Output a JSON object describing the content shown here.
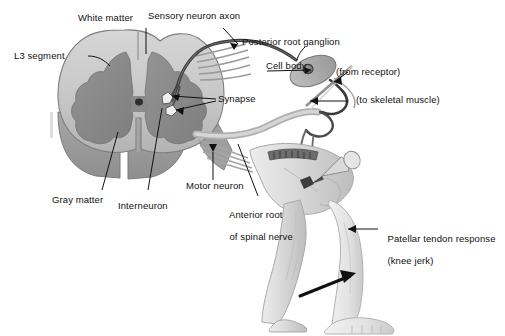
{
  "figure": {
    "type": "anatomical-diagram",
    "palette": {
      "white_matter": "#c9c9c9",
      "gray_matter": "#8a8a8a",
      "outline": "#6e6e6e",
      "nerve_dark": "#3c3c3c",
      "skin": "#d8d8d8",
      "text": "#111111",
      "background": "#ffffff"
    }
  },
  "labels": {
    "white_matter": "White matter",
    "sensory_neuron_axon": "Sensory neuron axon",
    "posterior_root_ganglion": "Posterior root ganglion",
    "cell_body": "Cell body",
    "from_receptor": "(from receptor)",
    "to_skeletal_muscle": "(to skeletal muscle)",
    "l3_segment": "L3 segment",
    "synapse": "Synapse",
    "gray_matter": "Gray matter",
    "interneuron": "Interneuron",
    "motor_neuron": "Motor neuron",
    "anterior_root_line1": "Anterior root",
    "anterior_root_line2": "of spinal nerve",
    "patellar_line1": "Patellar tendon response",
    "patellar_line2": "(knee jerk)"
  },
  "structures": [
    {
      "name": "spinal-cord-cross-section",
      "region": "left"
    },
    {
      "name": "gray-matter-butterfly",
      "region": "center-left"
    },
    {
      "name": "central-canal",
      "region": "center-left"
    },
    {
      "name": "posterior-root-ganglion",
      "region": "top-right"
    },
    {
      "name": "sensory-axon",
      "region": "top-center"
    },
    {
      "name": "motor-axon",
      "region": "center-right"
    },
    {
      "name": "leg-flexed",
      "region": "right"
    },
    {
      "name": "leg-extended",
      "region": "right"
    },
    {
      "name": "reflex-hammer",
      "region": "center-right"
    },
    {
      "name": "kick-motion-arrow",
      "region": "bottom-right"
    }
  ]
}
